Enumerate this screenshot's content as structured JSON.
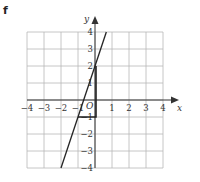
{
  "part_label": "f",
  "chart_data": {
    "type": "line",
    "title": "",
    "xlabel": "x",
    "ylabel": "y",
    "origin_label": "O",
    "xlim": [
      -4,
      4
    ],
    "ylim": [
      -4,
      4
    ],
    "grid": true,
    "x_ticks": [
      "-4",
      "-3",
      "-2",
      "-1",
      "1",
      "2",
      "3",
      "4"
    ],
    "y_ticks": [
      "4",
      "3",
      "2",
      "1",
      "-1",
      "-2",
      "-3",
      "-4"
    ],
    "series": [
      {
        "name": "y = 3x + 2",
        "points": [
          [
            -2,
            -4
          ],
          [
            0.667,
            4
          ]
        ]
      }
    ],
    "annotations": [
      {
        "type": "right-triangle",
        "vertices": [
          [
            -1,
            -1
          ],
          [
            0,
            -1
          ],
          [
            0,
            2
          ]
        ],
        "note": "rise 3 over run 1"
      }
    ],
    "colors": {
      "grid": "#b8b8b8",
      "axis": "#333333",
      "line": "#222222"
    }
  }
}
